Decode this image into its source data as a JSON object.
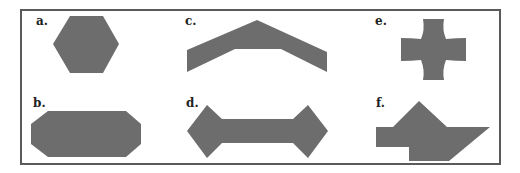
{
  "figure": {
    "fill_color": "#6d6d6d",
    "border_color": "#5a5a5a",
    "panels": [
      {
        "id": "a",
        "label": "a.",
        "shape": "hexagon"
      },
      {
        "id": "b",
        "label": "b.",
        "shape": "elongated-octagon"
      },
      {
        "id": "c",
        "label": "c.",
        "shape": "chevron"
      },
      {
        "id": "d",
        "label": "d.",
        "shape": "bone"
      },
      {
        "id": "e",
        "label": "e.",
        "shape": "concave-cross"
      },
      {
        "id": "f",
        "label": "f.",
        "shape": "irregular-polygon"
      }
    ]
  }
}
